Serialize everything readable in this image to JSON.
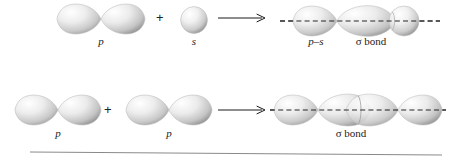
{
  "figure": {
    "type": "orbital-overlap-diagram",
    "background_color": "#ffffff",
    "orbital_fill_light": "#fbfbfb",
    "orbital_fill_mid": "#d8d8d8",
    "orbital_fill_dark": "#9a9a9a",
    "axis_color": "#1a1a1a",
    "rule_color": "#8a8a8a"
  },
  "rows": [
    {
      "id": "p-plus-s",
      "reactants": [
        {
          "label": "p",
          "shape": "p-orbital",
          "italic": true
        },
        {
          "label": "s",
          "shape": "s-orbital",
          "italic": true
        }
      ],
      "operator": "+",
      "arrow": "right-arrow",
      "product": {
        "shape": "p-s-overlap",
        "labels": [
          {
            "text": "p–s",
            "italic": true
          },
          {
            "text": "σ bond",
            "italic": false
          }
        ]
      }
    },
    {
      "id": "p-plus-p",
      "reactants": [
        {
          "label": "p",
          "shape": "p-orbital",
          "italic": true
        },
        {
          "label": "p",
          "shape": "p-orbital",
          "italic": true
        }
      ],
      "operator": "+",
      "arrow": "right-arrow",
      "product": {
        "shape": "p-p-overlap",
        "labels": [
          {
            "text": "σ bond",
            "italic": false
          }
        ]
      }
    }
  ],
  "footer_rule": {
    "present": true
  }
}
